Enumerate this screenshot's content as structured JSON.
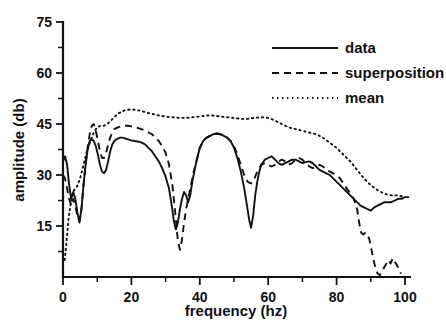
{
  "chart_data": {
    "type": "line",
    "title": "",
    "xlabel": "frequency (hz)",
    "ylabel": "amplitude (db)",
    "xlim": [
      0,
      102
    ],
    "ylim": [
      0,
      75
    ],
    "xticks": [
      0,
      20,
      40,
      60,
      80,
      100
    ],
    "xtick_labels": [
      "0",
      "20",
      "40",
      "60",
      "80",
      "100"
    ],
    "xtick_minor_step": 10,
    "yticks": [
      15,
      30,
      45,
      60,
      75
    ],
    "ytick_labels": [
      "15",
      "30",
      "45",
      "60",
      "75"
    ],
    "ytick_minor_step": 7.5,
    "grid": false,
    "legend_position": "top-right",
    "series": [
      {
        "name": "data",
        "style": "solid",
        "color": "#111111",
        "x": [
          0.0,
          0.6,
          1.2,
          1.8,
          2.4,
          3.0,
          3.6,
          4.2,
          4.8,
          5.4,
          6.0,
          6.6,
          7.2,
          7.8,
          8.4,
          9.0,
          9.6,
          10.2,
          10.8,
          11.4,
          12.0,
          12.6,
          13.2,
          13.8,
          14.4,
          15.0,
          15.6,
          16.2,
          16.8,
          17.4,
          18.0,
          19.0,
          20.0,
          21.0,
          22.0,
          23.0,
          24.0,
          25.0,
          26.0,
          27.0,
          28.0,
          29.0,
          30.0,
          31.0,
          31.8,
          32.4,
          33.0,
          33.6,
          34.2,
          34.8,
          35.4,
          36.0,
          36.6,
          37.2,
          37.8,
          38.4,
          39.0,
          40.0,
          41.0,
          42.0,
          43.0,
          44.0,
          45.0,
          46.0,
          47.0,
          48.0,
          49.0,
          50.0,
          51.0,
          52.0,
          53.0,
          53.8,
          54.4,
          55.0,
          55.6,
          56.2,
          56.8,
          57.4,
          58.0,
          59.0,
          60.0,
          61.0,
          62.0,
          63.0,
          64.0,
          65.0,
          66.0,
          67.0,
          68.0,
          69.0,
          70.0,
          71.0,
          72.0,
          73.0,
          74.0,
          75.0,
          76.0,
          77.0,
          78.0,
          79.0,
          80.0,
          81.0,
          82.0,
          83.0,
          84.0,
          85.0,
          86.0,
          87.0,
          88.0,
          89.0,
          90.0,
          91.0,
          92.0,
          93.0,
          94.0,
          95.0,
          96.0,
          97.0,
          98.0,
          99.0,
          100.0,
          101.0
        ],
        "y": [
          34.0,
          35.5,
          33.0,
          27.0,
          23.0,
          25.0,
          23.0,
          19.0,
          16.0,
          20.0,
          27.0,
          33.0,
          37.5,
          40.0,
          40.5,
          40.0,
          38.5,
          36.0,
          33.0,
          31.0,
          30.5,
          31.5,
          34.0,
          37.0,
          39.0,
          40.0,
          40.5,
          40.8,
          41.0,
          41.0,
          40.8,
          40.5,
          40.2,
          40.0,
          39.8,
          39.5,
          39.0,
          38.0,
          37.0,
          35.5,
          34.0,
          32.0,
          29.5,
          26.0,
          21.0,
          16.5,
          14.0,
          16.0,
          20.0,
          23.0,
          25.0,
          24.0,
          22.0,
          24.0,
          28.0,
          31.0,
          34.0,
          38.0,
          40.0,
          41.0,
          41.5,
          42.0,
          42.2,
          42.0,
          41.5,
          41.0,
          40.0,
          38.0,
          35.0,
          31.0,
          26.0,
          21.0,
          17.0,
          14.5,
          18.0,
          24.0,
          28.0,
          31.0,
          33.0,
          34.5,
          35.0,
          35.5,
          34.5,
          33.5,
          33.0,
          33.5,
          34.0,
          34.5,
          34.5,
          34.0,
          33.5,
          33.8,
          34.0,
          33.5,
          32.5,
          31.5,
          31.0,
          30.5,
          30.0,
          29.0,
          28.0,
          27.0,
          26.0,
          25.0,
          24.0,
          23.0,
          22.0,
          21.0,
          20.5,
          20.0,
          19.5,
          20.5,
          21.0,
          21.5,
          22.0,
          22.0,
          22.0,
          22.5,
          23.0,
          23.0,
          23.5,
          23.5
        ]
      },
      {
        "name": "superposition",
        "style": "dashed",
        "color": "#111111",
        "x": [
          0.0,
          0.6,
          1.2,
          1.8,
          2.4,
          3.0,
          3.6,
          4.2,
          4.8,
          5.4,
          6.0,
          6.6,
          7.2,
          7.8,
          8.4,
          9.0,
          9.6,
          10.2,
          10.8,
          11.4,
          12.0,
          12.6,
          13.2,
          13.8,
          14.4,
          15.0,
          16.0,
          17.0,
          18.0,
          19.0,
          20.0,
          21.0,
          22.0,
          23.0,
          24.0,
          25.0,
          26.0,
          27.0,
          28.0,
          29.0,
          30.0,
          31.0,
          32.0,
          33.0,
          33.6,
          34.2,
          34.8,
          35.4,
          36.0,
          37.0,
          38.0,
          39.0,
          40.0,
          41.0,
          42.0,
          43.0,
          44.0,
          45.0,
          46.0,
          47.0,
          48.0,
          49.0,
          50.0,
          51.0,
          52.0,
          53.0,
          54.0,
          55.0,
          56.0,
          57.0,
          58.0,
          59.0,
          60.0,
          61.0,
          62.0,
          63.0,
          64.0,
          65.0,
          66.0,
          67.0,
          68.0,
          69.0,
          70.0,
          71.0,
          72.0,
          73.0,
          74.0,
          75.0,
          76.0,
          77.0,
          78.0,
          79.0,
          80.0,
          81.0,
          82.0,
          83.0,
          84.0,
          85.0,
          86.0,
          86.6,
          87.2,
          87.8,
          88.4,
          89.0,
          89.6,
          90.2,
          90.8,
          91.4,
          92.0,
          92.6,
          93.2,
          94.0,
          94.6,
          95.2,
          95.8,
          96.4,
          97.0,
          97.6,
          98.2,
          98.8
        ],
        "y": [
          30.0,
          29.0,
          26.0,
          23.0,
          21.0,
          23.0,
          21.0,
          18.0,
          16.5,
          20.0,
          27.0,
          33.0,
          38.0,
          42.0,
          44.5,
          45.0,
          43.0,
          40.0,
          37.0,
          35.0,
          35.0,
          36.5,
          39.0,
          41.0,
          42.5,
          43.5,
          44.0,
          44.3,
          44.5,
          44.5,
          44.3,
          44.0,
          43.8,
          43.5,
          43.0,
          42.5,
          42.0,
          41.0,
          40.0,
          38.5,
          36.5,
          33.0,
          27.0,
          17.0,
          10.5,
          8.0,
          11.0,
          16.0,
          20.0,
          25.0,
          30.0,
          34.0,
          38.0,
          40.0,
          41.0,
          41.5,
          42.0,
          42.2,
          42.0,
          41.5,
          41.0,
          40.0,
          38.5,
          36.0,
          33.0,
          30.0,
          28.0,
          27.5,
          29.0,
          31.5,
          33.0,
          33.5,
          33.0,
          32.5,
          33.0,
          34.0,
          34.5,
          34.0,
          33.0,
          33.5,
          34.5,
          35.0,
          34.5,
          33.5,
          32.5,
          32.0,
          32.5,
          33.0,
          32.5,
          31.5,
          31.0,
          30.5,
          30.0,
          29.0,
          27.5,
          26.0,
          24.5,
          23.0,
          20.0,
          16.0,
          13.0,
          12.5,
          13.0,
          12.5,
          11.0,
          8.0,
          5.0,
          2.5,
          1.0,
          0.5,
          1.5,
          3.0,
          4.0,
          5.0,
          4.0,
          5.5,
          4.5,
          3.5,
          2.5,
          1.0
        ]
      },
      {
        "name": "mean",
        "style": "dotted",
        "color": "#111111",
        "x": [
          0.5,
          1.0,
          1.5,
          2.0,
          2.5,
          3.0,
          3.5,
          4.0,
          4.5,
          5.0,
          6.0,
          7.0,
          8.0,
          9.0,
          10.0,
          11.0,
          12.0,
          13.0,
          14.0,
          15.0,
          16.0,
          17.0,
          18.0,
          19.0,
          20.0,
          21.0,
          22.0,
          23.0,
          24.0,
          25.0,
          26.0,
          27.0,
          28.0,
          30.0,
          32.0,
          34.0,
          36.0,
          38.0,
          40.0,
          42.0,
          44.0,
          46.0,
          48.0,
          50.0,
          52.0,
          54.0,
          56.0,
          58.0,
          60.0,
          62.0,
          64.0,
          66.0,
          68.0,
          70.0,
          72.0,
          74.0,
          76.0,
          78.0,
          80.0,
          82.0,
          84.0,
          86.0,
          88.0,
          90.0,
          92.0,
          94.0,
          96.0,
          98.0,
          100.0
        ],
        "y": [
          5.0,
          10.0,
          16.0,
          20.0,
          23.0,
          25.0,
          26.0,
          26.5,
          27.5,
          29.0,
          33.0,
          37.0,
          40.0,
          42.5,
          44.0,
          44.5,
          44.5,
          45.0,
          46.0,
          47.0,
          48.0,
          48.5,
          49.0,
          49.2,
          49.3,
          49.2,
          49.0,
          48.8,
          48.5,
          48.2,
          48.0,
          47.8,
          47.5,
          47.2,
          47.0,
          46.8,
          46.8,
          47.0,
          47.2,
          47.5,
          47.5,
          47.2,
          47.0,
          46.8,
          46.5,
          46.5,
          46.8,
          47.0,
          46.8,
          46.0,
          45.0,
          44.0,
          43.5,
          43.0,
          42.5,
          42.0,
          41.0,
          39.5,
          38.0,
          36.0,
          34.0,
          31.5,
          29.0,
          27.0,
          25.5,
          24.5,
          24.0,
          24.0,
          23.5
        ]
      }
    ]
  },
  "legend": {
    "items": [
      {
        "label": "data",
        "style": "solid"
      },
      {
        "label": "superposition",
        "style": "dashed"
      },
      {
        "label": "mean",
        "style": "dotted"
      }
    ]
  }
}
